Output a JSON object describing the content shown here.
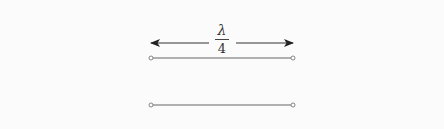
{
  "diagram": {
    "label": {
      "numerator": "λ",
      "denominator": "4"
    },
    "colors": {
      "background": "#fbfbfb",
      "line": "#555555",
      "arrow": "#222222"
    },
    "elements": [
      {
        "type": "double-arrow",
        "x1": 151,
        "x2": 293,
        "y": 43
      },
      {
        "type": "wire",
        "x1": 151,
        "x2": 293,
        "y": 58,
        "end_markers": "open-circle"
      },
      {
        "type": "wire",
        "x1": 151,
        "x2": 293,
        "y": 105,
        "end_markers": "open-circle"
      }
    ]
  }
}
